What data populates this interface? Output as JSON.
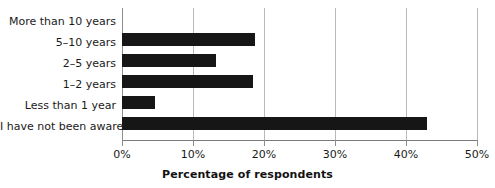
{
  "chart_data": {
    "type": "bar",
    "orientation": "horizontal",
    "title": "",
    "xlabel": "Percentage of respondents",
    "ylabel": "",
    "categories": [
      "More than 10 years",
      "5–10 years",
      "2–5 years",
      "1–2 years",
      "Less than 1 year",
      "I have not been aware"
    ],
    "values": [
      0,
      18.7,
      13.2,
      18.5,
      4.6,
      43.0
    ],
    "values_display": [
      "0%",
      "18.7%",
      "13.2%",
      "18.5%",
      "4.6%",
      "43%"
    ],
    "xlim": [
      0,
      50
    ],
    "xticks": [
      0,
      10,
      20,
      30,
      40,
      50
    ],
    "xtick_labels": [
      "0%",
      "10%",
      "20%",
      "30%",
      "40%",
      "50%"
    ],
    "grid": true,
    "grid_axis": "x",
    "legend": false,
    "bar_color": "#161616",
    "grid_color": "#b9b9b9",
    "axis_color": "#7a7a7a",
    "text_color": "#1a1a1a"
  }
}
